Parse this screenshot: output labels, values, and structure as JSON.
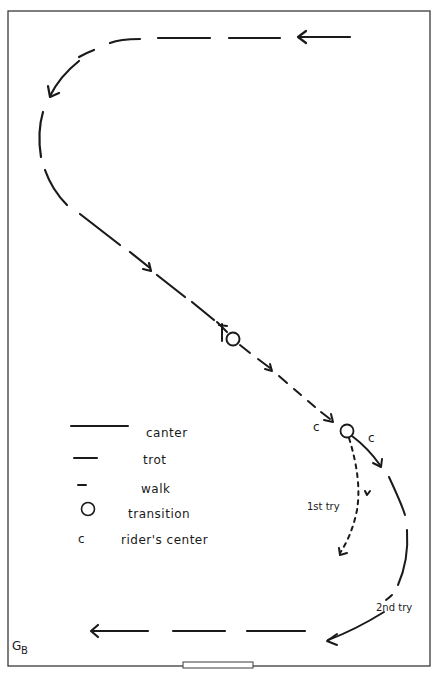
{
  "diagram": {
    "type": "riding-arena-path",
    "arena_border_color": "#3a3a3a",
    "ink_color": "#1a1a1a"
  },
  "legend": {
    "items": [
      {
        "symbol": "long-dash",
        "label": "canter"
      },
      {
        "symbol": "medium-dash",
        "label": "trot"
      },
      {
        "symbol": "short-dash",
        "label": "walk"
      },
      {
        "symbol": "circle",
        "label": "transition"
      },
      {
        "symbol": "c",
        "label": "rider's center"
      }
    ]
  },
  "annotations": {
    "rider_center_before": "c",
    "rider_center_after": "c",
    "first_try": "1st try",
    "second_try": "2nd try",
    "corner_mark": "G",
    "corner_mark_sub": "B"
  },
  "path": {
    "segments": [
      {
        "gait": "trot",
        "from": "top-right",
        "direction": "left"
      },
      {
        "gait": "trot",
        "region": "left-curve"
      },
      {
        "gait": "trot",
        "region": "diagonal-upper"
      },
      {
        "gait": "walk",
        "region": "diagonal-lower",
        "marker": "transition-with-x"
      },
      {
        "gait": "canter",
        "region": "right-curve",
        "attempt": "2nd try"
      },
      {
        "gait": "walk",
        "region": "inner-curve",
        "attempt": "1st try"
      },
      {
        "gait": "trot",
        "region": "bottom",
        "direction": "left"
      }
    ]
  }
}
